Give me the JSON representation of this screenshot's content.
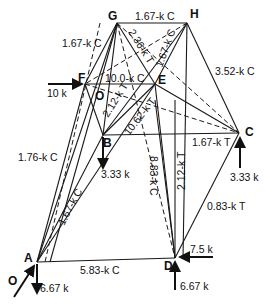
{
  "diagram": {
    "type": "space-truss-free-body",
    "nodes": {
      "A": {
        "label": "A",
        "x": 37,
        "y": 262
      },
      "B": {
        "label": "B",
        "x": 103,
        "y": 135
      },
      "C": {
        "label": "C",
        "x": 239,
        "y": 133
      },
      "D": {
        "label": "D",
        "x": 175,
        "y": 258
      },
      "E": {
        "label": "E",
        "x": 155,
        "y": 84
      },
      "F": {
        "label": "F",
        "x": 85,
        "y": 84
      },
      "G": {
        "label": "G",
        "x": 117,
        "y": 23
      },
      "H": {
        "label": "H",
        "x": 187,
        "y": 23
      },
      "O": {
        "label": "O"
      }
    },
    "members": [
      {
        "from": "G",
        "to": "H",
        "label": "1.67-k C"
      },
      {
        "from": "G",
        "to": "F",
        "label": "1.67-k C"
      },
      {
        "from": "G",
        "to": "E",
        "label": "2.36-k T"
      },
      {
        "from": "H",
        "to": "B",
        "label": "1.67-k C"
      },
      {
        "from": "H",
        "to": "C",
        "label": "3.52-k C"
      },
      {
        "from": "F",
        "to": "E",
        "label": "10.0-k C"
      },
      {
        "from": "F",
        "to": "B",
        "label": "2.12-k T"
      },
      {
        "from": "E",
        "to": "C",
        "label": "10.62-k T"
      },
      {
        "from": "B",
        "to": "C",
        "label": "1.67-k T"
      },
      {
        "from": "G",
        "to": "A",
        "label": "1.76-k C"
      },
      {
        "from": "B",
        "to": "A",
        "label": "1.67-k C"
      },
      {
        "from": "E",
        "to": "D",
        "label": "8.83-k C"
      },
      {
        "from": "C",
        "to": "D",
        "label": "0.83-k T"
      },
      {
        "from": "E",
        "to": "D2",
        "label": "2.12-k T"
      },
      {
        "from": "A",
        "to": "D",
        "label": "5.83-k C"
      }
    ],
    "loads": [
      {
        "node": "F",
        "label": "10 k",
        "direction": "right"
      },
      {
        "node": "B",
        "label": "3.33 k",
        "direction": "down"
      },
      {
        "node": "C",
        "label": "3.33 k",
        "direction": "up"
      },
      {
        "node": "D",
        "label": "7.5 k",
        "direction": "left"
      },
      {
        "node": "D",
        "label": "6.67 k",
        "direction": "up"
      },
      {
        "node": "A",
        "label": "6.67 k",
        "direction": "down"
      },
      {
        "node": "A",
        "label": "O",
        "direction": "diagonal"
      }
    ]
  }
}
